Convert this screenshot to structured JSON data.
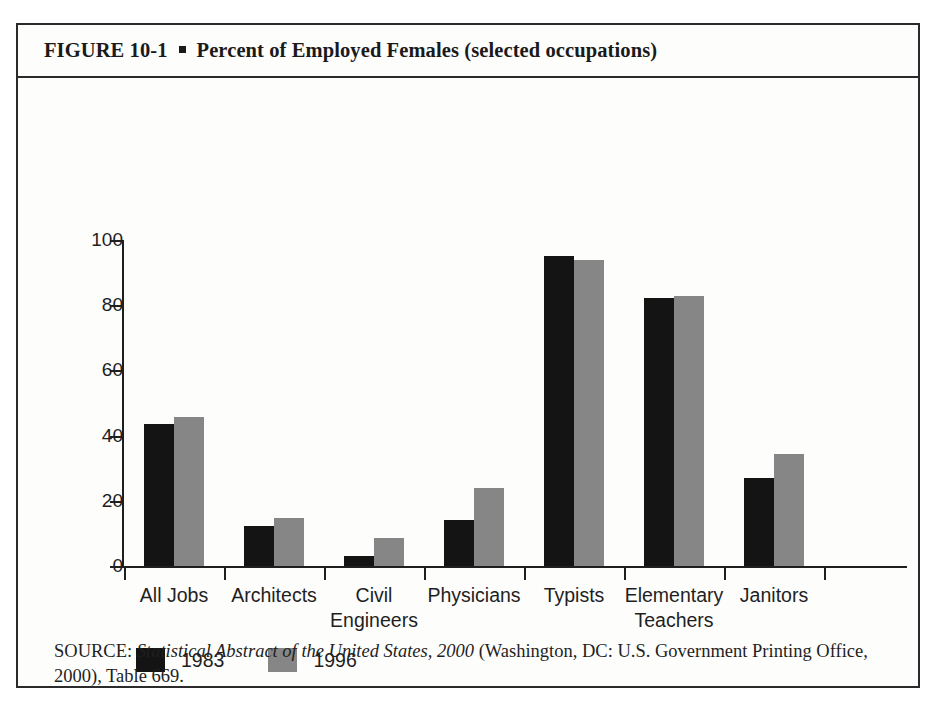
{
  "figure": {
    "number": "FIGURE  10-1",
    "bullet": "square-bullet",
    "title": "Percent of Employed Females (selected occupations)"
  },
  "source": {
    "prefix": "SOURCE:",
    "publication": "Statistical Abstract of the United States, 2000",
    "rest": "(Washington, DC: U.S. Government Printing Office, 2000), Table 669."
  },
  "colors": {
    "series_1983": "#141414",
    "series_1996": "#868686",
    "axis": "#1f1f1f",
    "frame": "#2b2b2b",
    "background": "#fdfdfc"
  },
  "chart_data": {
    "type": "bar",
    "title": "Percent of Employed Females (selected occupations)",
    "xlabel": "",
    "ylabel": "",
    "ylim": [
      0,
      100
    ],
    "yticks": [
      0,
      20,
      40,
      60,
      80,
      100
    ],
    "grid": false,
    "legend_position": "bottom-left",
    "categories": [
      "All Jobs",
      "Architects",
      "Civil Engineers",
      "Physicians",
      "Typists",
      "Elementary Teachers",
      "Janitors"
    ],
    "category_lines": [
      [
        "All Jobs"
      ],
      [
        "Architects"
      ],
      [
        "Civil",
        "Engineers"
      ],
      [
        "Physicians"
      ],
      [
        "Typists"
      ],
      [
        "Elementary",
        "Teachers"
      ],
      [
        "Janitors"
      ]
    ],
    "series": [
      {
        "name": "1983",
        "color": "#141414",
        "values": [
          43.5,
          12.3,
          3.0,
          14.1,
          95.0,
          82.2,
          27.0
        ]
      },
      {
        "name": "1996",
        "color": "#868686",
        "values": [
          45.7,
          14.7,
          8.6,
          23.9,
          94.0,
          82.8,
          34.4
        ]
      }
    ]
  }
}
